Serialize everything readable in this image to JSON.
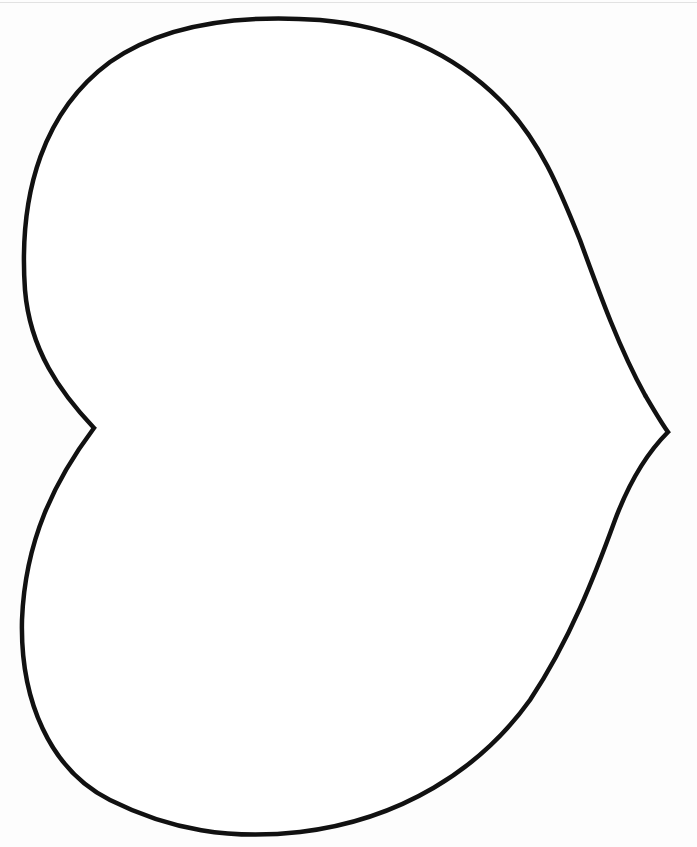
{
  "image": {
    "subject": "heart outline template",
    "background_color": "#fdfdfd",
    "stroke_color": "#111111",
    "stroke_width": 4.5,
    "outline_points": {
      "top_left_lobe_peak": [
        250,
        18
      ],
      "right_tip": [
        668,
        432
      ],
      "left_notch": [
        94,
        428
      ],
      "bottom_left_lobe": [
        180,
        830
      ]
    },
    "bleed_through_text_visible": false
  }
}
